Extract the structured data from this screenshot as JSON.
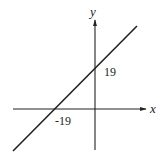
{
  "diagram": {
    "axes": {
      "x_label": "x",
      "y_label": "y"
    },
    "line": {
      "description": "straight line with positive slope",
      "x_intercept_label": "-19",
      "y_intercept_label": "19"
    },
    "colors": {
      "stroke": "#222222",
      "background": "#ffffff"
    }
  }
}
